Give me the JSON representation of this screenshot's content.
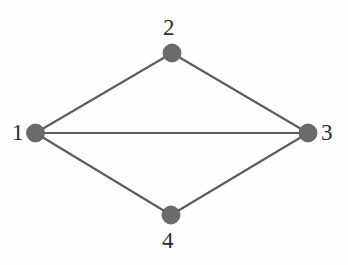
{
  "figure": {
    "name": "undirected-graph-diagram",
    "background_color": "#fefefe",
    "width": 348,
    "height": 265
  },
  "style": {
    "node_fill": "#6b6b6b",
    "node_stroke": "#5a5a5a",
    "node_radius": 9,
    "edge_color": "#5e5e5e",
    "edge_width": 2.2,
    "label_color": "#2b2b2b",
    "label_font_size": 23
  },
  "chart_data": {
    "type": "diagram",
    "title": "",
    "xlabel": "",
    "ylabel": "",
    "graph_kind": "undirected simple graph",
    "node_count": 4,
    "edge_count": 5,
    "nodes": [
      {
        "id": "1",
        "label": "1",
        "cx": 35.5,
        "cy": 133,
        "r": 9,
        "label_x": 12,
        "label_y": 121,
        "label_anchor": "left"
      },
      {
        "id": "2",
        "label": "2",
        "cx": 172,
        "cy": 53,
        "r": 9,
        "label_x": 163,
        "label_y": 16,
        "label_anchor": "center"
      },
      {
        "id": "3",
        "label": "3",
        "cx": 308,
        "cy": 133,
        "r": 9,
        "label_x": 321,
        "label_y": 121,
        "label_anchor": "left"
      },
      {
        "id": "4",
        "label": "4",
        "cx": 171,
        "cy": 215,
        "r": 9,
        "label_x": 162,
        "label_y": 229,
        "label_anchor": "center"
      }
    ],
    "edges": [
      {
        "source": "1",
        "target": "2"
      },
      {
        "source": "2",
        "target": "3"
      },
      {
        "source": "1",
        "target": "3"
      },
      {
        "source": "1",
        "target": "4"
      },
      {
        "source": "4",
        "target": "3"
      }
    ],
    "adjacency": {
      "1": [
        "2",
        "3",
        "4"
      ],
      "2": [
        "1",
        "3"
      ],
      "3": [
        "1",
        "2",
        "4"
      ],
      "4": [
        "1",
        "3"
      ]
    },
    "degrees": {
      "1": 3,
      "2": 2,
      "3": 3,
      "4": 2
    }
  }
}
